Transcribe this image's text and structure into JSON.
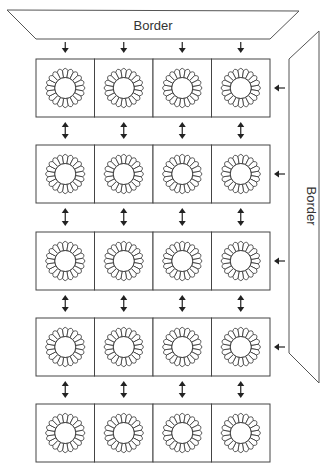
{
  "diagram": {
    "top_border": {
      "label": "Border"
    },
    "right_border": {
      "label": "Border"
    },
    "grid": {
      "rows": 5,
      "columns": 4
    },
    "cell_content": "flower-pattern-icon",
    "arrows": {
      "from_top_border": "down",
      "from_right_border": "left",
      "between_rows": "bidirectional"
    },
    "colors": {
      "line": "#444444",
      "background": "#ffffff",
      "text": "#333333"
    }
  }
}
